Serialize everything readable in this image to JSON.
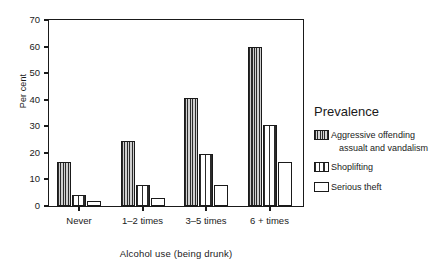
{
  "chart_data": {
    "type": "bar",
    "title": "",
    "xlabel": "Alcohol use (being drunk)",
    "ylabel": "Per cent",
    "categories": [
      "Never",
      "1–2 times",
      "3–5 times",
      "6 + times"
    ],
    "series": [
      {
        "name": "Aggressive offending assualt and vandalism",
        "name_line1": "Aggressive offending",
        "name_line2": "assualt and vandalism",
        "pattern": "dense-vertical-hatch",
        "values": [
          16.5,
          24.5,
          40.5,
          60
        ]
      },
      {
        "name": "Shoplifting",
        "name_line1": "Shoplifting",
        "name_line2": "",
        "pattern": "wide-vertical-stripes",
        "values": [
          4,
          8,
          19.5,
          30.5
        ]
      },
      {
        "name": "Serious theft",
        "name_line1": "Serious theft",
        "name_line2": "",
        "pattern": "solid-white",
        "values": [
          2,
          3,
          8,
          16.5
        ]
      }
    ],
    "ylim": [
      0,
      70
    ],
    "yticks": [
      0,
      10,
      20,
      30,
      40,
      50,
      60,
      70
    ],
    "ytick_labels": [
      "0",
      "10",
      "20",
      "30",
      "40",
      "50",
      "60",
      "70"
    ],
    "grid": false,
    "legend_position": "right",
    "legend_title": "Prevalence"
  },
  "axis": {
    "y_title": "Per cent",
    "x_title": "Alcohol use (being drunk)"
  },
  "legend": {
    "title": "Prevalence"
  },
  "colors": {
    "ink": "#1a1a1a",
    "background": "#ffffff"
  }
}
